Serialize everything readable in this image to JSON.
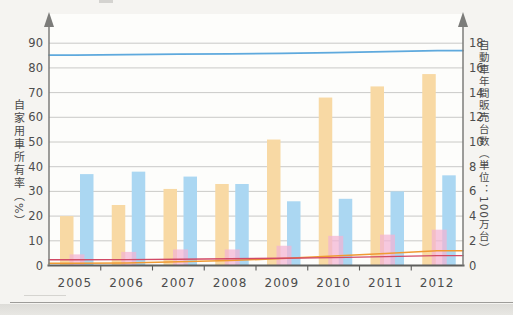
{
  "chart_data": {
    "type": "bar",
    "title": "",
    "categories": [
      "2005",
      "2006",
      "2007",
      "2008",
      "2009",
      "2010",
      "2011",
      "2012"
    ],
    "left_axis": {
      "label": "自家用車所有率（%）",
      "ticks": [
        0,
        10,
        20,
        30,
        40,
        50,
        60,
        70,
        80,
        90
      ],
      "range": [
        0,
        96
      ]
    },
    "right_axis": {
      "label": "自動車年間販売台数（単位：100万台）",
      "ticks": [
        0,
        2,
        4,
        6,
        8,
        10,
        12,
        14,
        16,
        18
      ],
      "range": [
        0,
        19.2
      ]
    },
    "grid": true,
    "legend_position": "none",
    "bar_series": [
      {
        "name": "orange-bars",
        "axis": "right",
        "color": "#f8d9a4",
        "opacity": 1,
        "values": [
          4.0,
          4.9,
          6.2,
          6.6,
          10.2,
          13.6,
          14.5,
          15.5
        ]
      },
      {
        "name": "blue-bars",
        "axis": "right",
        "color": "#abd7f2",
        "opacity": 1,
        "values": [
          7.4,
          7.6,
          7.2,
          6.6,
          5.2,
          5.4,
          6.0,
          7.3
        ]
      },
      {
        "name": "pink-bars",
        "axis": "right",
        "color": "#f2b3d2",
        "opacity": 0.72,
        "values": [
          0.9,
          1.1,
          1.3,
          1.3,
          1.6,
          2.4,
          2.5,
          2.9
        ]
      }
    ],
    "line_series": [
      {
        "name": "blue-line",
        "axis": "left",
        "color": "#5ea9dd",
        "width": 1.7,
        "values": [
          85.2,
          85.4,
          85.6,
          85.7,
          85.9,
          86.2,
          86.6,
          87.0
        ]
      },
      {
        "name": "orange-line",
        "axis": "left",
        "color": "#f09a33",
        "width": 1.5,
        "values": [
          0.9,
          1.0,
          1.5,
          2.0,
          2.8,
          3.8,
          4.9,
          6.0
        ]
      },
      {
        "name": "red-line",
        "axis": "left",
        "color": "#d14a66",
        "width": 1.4,
        "values": [
          2.3,
          2.4,
          2.5,
          2.7,
          2.9,
          3.2,
          3.6,
          4.0
        ]
      }
    ]
  }
}
